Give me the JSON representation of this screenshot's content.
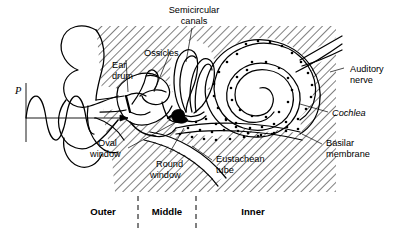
{
  "figure": {
    "background_color": "#ffffff",
    "ink_color": "#000000"
  },
  "axis": {
    "pressure_symbol": "P",
    "description": "Incoming sound pressure wave with direction arrow into ear canal"
  },
  "labels": {
    "semicircular_canals": {
      "line1": "Semicircular",
      "line2": "canals"
    },
    "ossicles": "Ossicles",
    "ear_drum": {
      "line1": "Ear",
      "line2": "drum"
    },
    "auditory_nerve": {
      "line1": "Auditory",
      "line2": "nerve"
    },
    "cochlea": "Cochlea",
    "basilar_membrane": {
      "line1": "Basilar",
      "line2": "membrane"
    },
    "oval_window": {
      "line1": "Oval",
      "line2": "window"
    },
    "round_window": {
      "line1": "Round",
      "line2": "window"
    },
    "eustachean_tube": {
      "line1": "Eustachean",
      "line2": "tube"
    }
  },
  "regions": [
    {
      "name": "Outer",
      "label": "Outer"
    },
    {
      "name": "Middle",
      "label": "Middle"
    },
    {
      "name": "Inner",
      "label": "Inner"
    }
  ]
}
